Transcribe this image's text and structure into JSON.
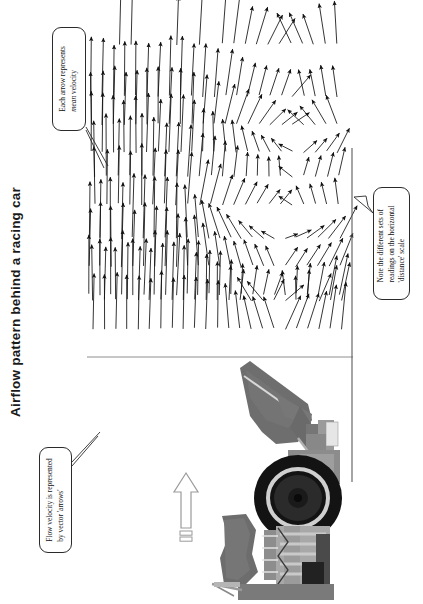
{
  "page": {
    "title": "Airflow pattern behind a racing car",
    "width": 423,
    "height": 604,
    "background_color": "#ffffff",
    "ink_color": "#111111",
    "orientation": "landscape-content-rotated-90"
  },
  "callouts": [
    {
      "id": "callout-arrow",
      "name": "callout-each-arrow",
      "line1": "Each arrow represents",
      "line2_italic": "mean",
      "line2_rest": " velocity",
      "leader_target": "vector-field-top-left"
    },
    {
      "id": "callout-flow",
      "name": "callout-flow-velocity",
      "line1": "Flow velocity is represented",
      "line2": "by vector 'arrows'",
      "leader_target": "vector-field-bottom-left"
    },
    {
      "id": "callout-scale",
      "name": "callout-distance-scale",
      "line1": "Note the different sets of",
      "line2": "readings on the horizontal",
      "line3": "'distance' scale",
      "leader_target": "vertical-distance-axis"
    }
  ],
  "axes": {
    "baseline_label": "ground-baseline",
    "vertical_label": "distance-scale-axis"
  },
  "flow_indicator": {
    "name": "flow-direction-arrow",
    "description": "hollow outline arrow indicating freestream flow direction"
  },
  "car": {
    "name": "racing-car-rear-photo",
    "parts": [
      "rear-wing",
      "rear-wheel",
      "tyre",
      "suspension",
      "diffuser",
      "bodywork"
    ]
  },
  "chart_data": {
    "type": "scatter",
    "title": "Airflow pattern behind a racing car",
    "xlabel": "",
    "ylabel": "",
    "grid": false,
    "legend": false,
    "annotations": [
      "Each arrow represents mean velocity",
      "Flow velocity is represented by vector 'arrows'",
      "Note the different sets of readings on the horizontal 'distance' scale"
    ],
    "bands": [
      {
        "name": "band-1-far-field",
        "arrow_count": 42,
        "mean_angle_deg": 90,
        "note": "uniform upward arrows, longest vectors"
      },
      {
        "name": "band-2-upper-wake",
        "arrow_count": 46,
        "mean_angle_deg": 80,
        "note": "arrows tilt and shorten near wake centre"
      },
      {
        "name": "band-3-wake-core",
        "arrow_count": 44,
        "mean_angle_deg": 45,
        "note": "strong direction scatter, short vectors, recirculation"
      },
      {
        "name": "band-4-lower-wake",
        "arrow_count": 48,
        "mean_angle_deg": 70,
        "note": "arrows re-align toward freestream"
      },
      {
        "name": "band-5-near-ground",
        "arrow_count": 50,
        "mean_angle_deg": 88,
        "note": "near-uniform arrows above baseline"
      }
    ]
  }
}
